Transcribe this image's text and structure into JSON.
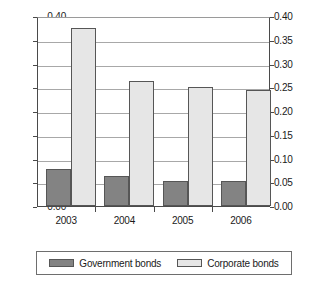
{
  "chart_data": {
    "type": "bar",
    "title": "",
    "subtitle": "",
    "xlabel": "",
    "ylabel": "",
    "categories": [
      "2003",
      "2004",
      "2005",
      "2006"
    ],
    "series": [
      {
        "name": "Government bonds",
        "color": "#838383",
        "values": [
          0.078,
          0.063,
          0.053,
          0.052
        ]
      },
      {
        "name": "Corporate bonds",
        "color": "#e6e6e6",
        "values": [
          0.375,
          0.263,
          0.251,
          0.244
        ]
      }
    ],
    "ylim": [
      0.0,
      0.4
    ],
    "ytick_step": 0.05,
    "ytick_labels": [
      "0.40",
      "0.35",
      "0.30",
      "0.25",
      "0.20",
      "0.15",
      "0.10",
      "0.05",
      "0.00"
    ],
    "ytick_values": [
      0.4,
      0.35,
      0.3,
      0.25,
      0.2,
      0.15,
      0.1,
      0.05,
      0.0
    ],
    "dual_axis": true,
    "ytick_labels_right": [
      "0.40",
      "0.35",
      "0.30",
      "0.25",
      "0.20",
      "0.15",
      "0.10",
      "0.05",
      "0.00"
    ],
    "grid": true,
    "legend_position": "bottom"
  },
  "legend": {
    "entries": [
      {
        "label": "Government bonds",
        "color": "#838383"
      },
      {
        "label": "Corporate bonds",
        "color": "#e6e6e6"
      }
    ]
  }
}
